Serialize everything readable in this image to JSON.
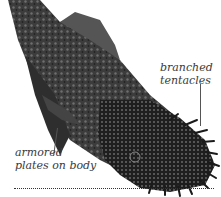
{
  "figure": {
    "annotations": [
      {
        "id": "tentacles",
        "lines": [
          "branched",
          "tentacles"
        ]
      },
      {
        "id": "plates",
        "lines": [
          "armored",
          "plates on body"
        ]
      }
    ],
    "colors": {
      "fish_dark": "#1c1c1c",
      "fish_mid": "#4a4a4a",
      "fish_light": "#8a8a8a",
      "text": "#3a3a3a",
      "background": "#ffffff"
    }
  }
}
